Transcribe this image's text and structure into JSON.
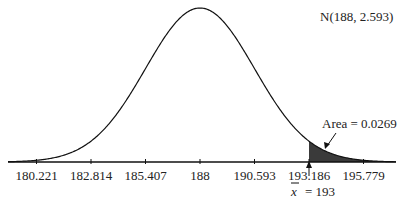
{
  "chart_data": {
    "type": "area",
    "title": "",
    "distribution_label": "N(188, 2.593)",
    "mean": 188,
    "sd": 2.593,
    "xlabel": "",
    "ylabel": "",
    "x_ticks": [
      180.221,
      182.814,
      185.407,
      188,
      190.593,
      193.186,
      195.779
    ],
    "x_tick_labels": [
      "180.221",
      "182.814",
      "185.407",
      "188",
      "190.593",
      "193.186",
      "195.779"
    ],
    "xlim": [
      178.5,
      196.5
    ],
    "grid": false,
    "shaded_region": {
      "from": 193,
      "to": 196.5,
      "color": "#3a3a3a"
    },
    "annotations": [
      {
        "text": "Area = 0.0269",
        "points_to": "shaded-tail"
      },
      {
        "text_bar": "x",
        "text_rest": " = 193",
        "points_to": 193
      }
    ]
  },
  "labels": {
    "dist": "N(188, 2.593)",
    "area": "Area = 0.0269",
    "xbar_symbol": "x",
    "xbar_value": "= 193"
  },
  "colors": {
    "curve": "#111111",
    "shade": "#3a3a3a",
    "text": "#222222"
  }
}
